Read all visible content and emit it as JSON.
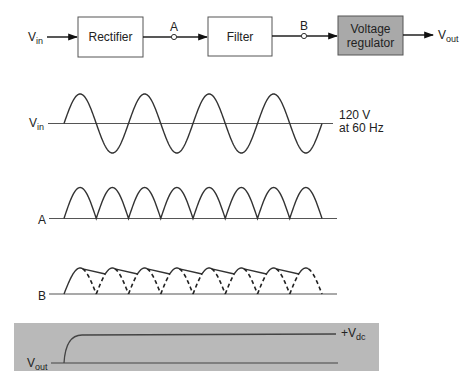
{
  "block_diagram": {
    "input_label": "V",
    "input_sub": "in",
    "blocks": [
      {
        "id": "rectifier",
        "label": "Rectifier",
        "fill": "#ffffff"
      },
      {
        "id": "filter",
        "label": "Filter",
        "fill": "#ffffff"
      },
      {
        "id": "regulator",
        "label_line1": "Voltage",
        "label_line2": "regulator",
        "fill": "#a9a9a9"
      }
    ],
    "nodes": [
      {
        "id": "A",
        "label": "A"
      },
      {
        "id": "B",
        "label": "B"
      }
    ],
    "output_label": "V",
    "output_sub": "out"
  },
  "waveforms": {
    "vin": {
      "label": "V",
      "label_sub": "in",
      "annotation_line1": "120 V",
      "annotation_line2": "at 60 Hz",
      "type": "sine",
      "cycles": 4
    },
    "a": {
      "label": "A",
      "type": "full-wave rectified",
      "humps": 8
    },
    "b": {
      "label": "B",
      "type": "filtered (ripple)",
      "humps": 8
    },
    "vout": {
      "label": "V",
      "label_sub": "out",
      "level_label": "+V",
      "level_sub": "dc",
      "type": "regulated dc",
      "panel_fill": "#b9b9b9"
    }
  }
}
